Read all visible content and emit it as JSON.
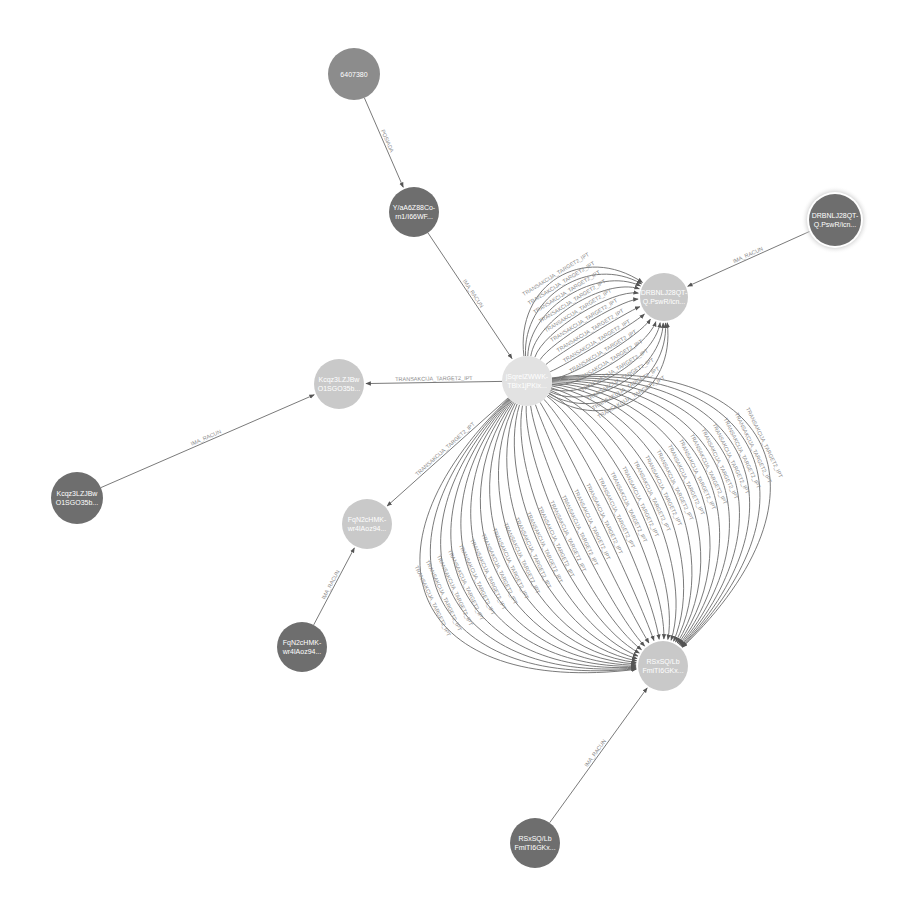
{
  "graph": {
    "colors": {
      "background": "#ffffff",
      "node_dark": "#6e6e6e",
      "node_mid": "#8c8c8c",
      "node_light": "#c9c9c9",
      "node_center": "#e2e2e2",
      "edge": "#6b6b6b",
      "edge_label": "#8a8a8a",
      "selected_halo": "#bdbdbd"
    },
    "nodes": [
      {
        "id": "n1",
        "label": "6407380",
        "label_lines": [
          "6407380"
        ],
        "x": 354,
        "y": 74,
        "r": 26,
        "color": "#8c8c8c"
      },
      {
        "id": "n2",
        "label": "Y/aA6Z88Co-rn1/I66WF...",
        "label_lines": [
          "Y/aA6Z88Co-",
          "rn1/I66WF..."
        ],
        "x": 414,
        "y": 212,
        "r": 25,
        "color": "#6e6e6e"
      },
      {
        "id": "n3",
        "label": "DRBNLJ28QT-Q.PswR/icn...",
        "label_lines": [
          "DRBNLJ28QT-",
          "Q.PswR/icn..."
        ],
        "x": 835,
        "y": 220,
        "r": 26,
        "color": "#6e6e6e",
        "selected": true
      },
      {
        "id": "n4",
        "label": "DRBNLJ28QT-Q.PswR/icn...",
        "label_lines": [
          "DRBNLJ28QT-",
          "Q.PswR/icn..."
        ],
        "x": 664,
        "y": 297,
        "r": 24,
        "color": "#c9c9c9"
      },
      {
        "id": "n5",
        "label": "jSqrelZWWK-TBlx1jPKix...",
        "label_lines": [
          "jSqrelZWWK-",
          "TBlx1jPKix..."
        ],
        "x": 527,
        "y": 381,
        "r": 25,
        "color": "#e2e2e2"
      },
      {
        "id": "n6",
        "label": "Kcqz3LZJBw-O1SGO35b...",
        "label_lines": [
          "Kcqz3LZJBw",
          "O1SGO35b..."
        ],
        "x": 339,
        "y": 384,
        "r": 25,
        "color": "#c9c9c9"
      },
      {
        "id": "n7",
        "label": "Kcqz3LZJBw-O1SGO35b...",
        "label_lines": [
          "Kcqz3LZJBw",
          "O1SGO35b..."
        ],
        "x": 77,
        "y": 498,
        "r": 26,
        "color": "#6e6e6e"
      },
      {
        "id": "n8",
        "label": "FqN2cHMK-wr4lAoz94...",
        "label_lines": [
          "FqN2cHMK-",
          "wr4lAoz94..."
        ],
        "x": 367,
        "y": 524,
        "r": 25,
        "color": "#c9c9c9"
      },
      {
        "id": "n9",
        "label": "FqN2cHMK-wr4lAoz94...",
        "label_lines": [
          "FqN2cHMK-",
          "wr4lAoz94..."
        ],
        "x": 302,
        "y": 647,
        "r": 25,
        "color": "#6e6e6e"
      },
      {
        "id": "n10",
        "label": "RSxSQ/Lb-FmiTI6GKx...",
        "label_lines": [
          "RSxSQ/Lb",
          "FmiTI6GKx..."
        ],
        "x": 663,
        "y": 666,
        "r": 25,
        "color": "#c9c9c9"
      },
      {
        "id": "n11",
        "label": "RSxSQ/Lb-FmiTI6GKx...",
        "label_lines": [
          "RSxSQ/Lb",
          "FmiTI6GKx..."
        ],
        "x": 535,
        "y": 843,
        "r": 25,
        "color": "#6e6e6e"
      }
    ],
    "edges": [
      {
        "from": "n1",
        "to": "n2",
        "label": "POSIADA"
      },
      {
        "from": "n2",
        "to": "n5",
        "label": "IMA_RACUN"
      },
      {
        "from": "n3",
        "to": "n4",
        "label": "IMA_RACUN"
      },
      {
        "from": "n5",
        "to": "n6",
        "label": "TRANSAKCIJA_TARGET2_IPT"
      },
      {
        "from": "n7",
        "to": "n6",
        "label": "IMA_RACUN"
      },
      {
        "from": "n5",
        "to": "n8",
        "label": "TRANSAKCIJA_TARGET2_IPT"
      },
      {
        "from": "n9",
        "to": "n8",
        "label": "IMA_RACUN"
      },
      {
        "from": "n11",
        "to": "n10",
        "label": "IMA_RACUN"
      }
    ],
    "multi_edges": [
      {
        "from": "n5",
        "to": "n4",
        "label": "TRANSAKCIJA_TARGET2_IPT",
        "count": 14
      },
      {
        "from": "n5",
        "to": "n10",
        "label": "TRANSAKCIJA_TARGET2_IPT",
        "count": 30
      }
    ]
  }
}
